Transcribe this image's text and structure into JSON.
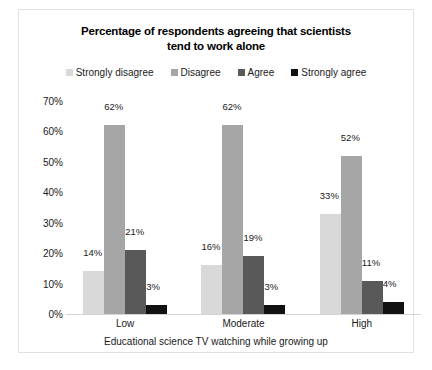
{
  "chart_data": {
    "type": "bar",
    "title": "Percentage of respondents agreeing that scientists tend to work alone",
    "title_line1": "Percentage of respondents agreeing that scientists",
    "title_line2": "tend to work alone",
    "xlabel": "Educational science TV watching while growing up",
    "ylabel": "",
    "ylim": [
      0,
      70
    ],
    "grid": false,
    "legend_position": "top",
    "categories": [
      "Low",
      "Moderate",
      "High"
    ],
    "ytick_labels": [
      "70%",
      "60%",
      "50%",
      "40%",
      "30%",
      "20%",
      "10%",
      "0%"
    ],
    "ytick_values": [
      70,
      60,
      50,
      40,
      30,
      20,
      10,
      0
    ],
    "series": [
      {
        "name": "Strongly disagree",
        "color": "#d9d9d9",
        "values": [
          14,
          16,
          33
        ],
        "labels": [
          "14%",
          "16%",
          "33%"
        ]
      },
      {
        "name": "Disagree",
        "color": "#a6a6a6",
        "values": [
          62,
          62,
          52
        ],
        "labels": [
          "62%",
          "62%",
          "52%"
        ]
      },
      {
        "name": "Agree",
        "color": "#595959",
        "values": [
          21,
          19,
          11
        ],
        "labels": [
          "21%",
          "19%",
          "11%"
        ]
      },
      {
        "name": "Strongly agree",
        "color": "#111111",
        "values": [
          3,
          3,
          4
        ],
        "labels": [
          "3%",
          "3%",
          "4%"
        ]
      }
    ]
  }
}
